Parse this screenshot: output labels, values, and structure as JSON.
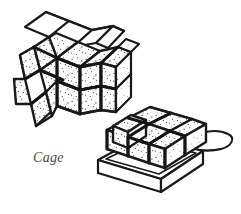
{
  "figure": {
    "title": "Cage",
    "caption": "Cage",
    "background_color": "#ffffff",
    "ink_color": "#1a1a1a",
    "mortar_color": "#141414",
    "block_fill": "#ffffff",
    "stipple_color": "#1a1a1a",
    "caption_color": "#4a4a4a",
    "medium": "stippled pen-and-ink line drawing",
    "objects": [
      {
        "name": "cage-house",
        "label": "Cage",
        "description": "House- or barn-shaped cage built from stippled cube blocks, with a peaked roof of plain white panels",
        "position": "upper-left",
        "long_side_grid": {
          "columns": 4,
          "rows": 2
        },
        "gable_end_grid": {
          "columns": 2,
          "rows": 2
        },
        "roof_panels_left": 4,
        "roof_panels_right": 5,
        "roof_panel_fill": "plain-white"
      },
      {
        "name": "block-stack-on-tray",
        "description": "Shallow rectangular tray holding a stack of stippled cube blocks, with a rounded loop handle projecting to the right",
        "position": "lower-right",
        "top_grid": {
          "columns": 3,
          "rows": 3
        },
        "front_grid": {
          "columns": 3,
          "rows": 1
        },
        "tray_wall_fill": "plain-white",
        "handle": "rounded-loop"
      }
    ]
  },
  "icons": {
    "cage_house": "cage-house-icon",
    "block_tray": "block-tray-icon",
    "tray_handle": "tray-handle-icon"
  }
}
